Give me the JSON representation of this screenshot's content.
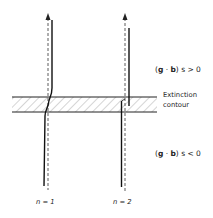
{
  "diagram": {
    "regions": {
      "upper_condition": {
        "prefix": "(",
        "g": "g",
        "dot": " · ",
        "b": "b",
        "suffix": ") s > 0"
      },
      "lower_condition": {
        "prefix": "(",
        "g": "g",
        "dot": " · ",
        "b": "b",
        "suffix": ") s < 0"
      }
    },
    "extinction_contour": {
      "line1": "Extinction",
      "line2": "contour"
    },
    "dislocations": [
      {
        "label": "n = 1"
      },
      {
        "label": "n = 2"
      }
    ],
    "colors": {
      "ink": "#222222",
      "hatch": "#555555",
      "background": "#ffffff"
    }
  }
}
